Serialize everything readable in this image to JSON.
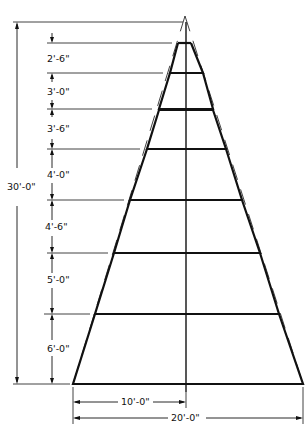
{
  "diagram": {
    "title": "",
    "ink_color": "#111111",
    "background": "#ffffff",
    "overall_height_label": "30'-0\"",
    "half_base_label": "10'-0\"",
    "base_width_label": "20'-0\"",
    "tiers": [
      {
        "label": "2'-6\""
      },
      {
        "label": "3'-0\""
      },
      {
        "label": "3'-6\""
      },
      {
        "label": "4'-0\""
      },
      {
        "label": "4'-6\""
      },
      {
        "label": "5'-0\""
      },
      {
        "label": "6'-0\""
      }
    ]
  }
}
